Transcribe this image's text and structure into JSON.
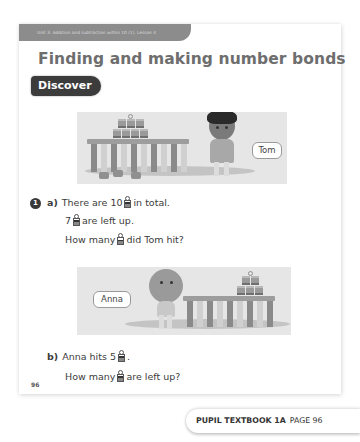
{
  "header": {
    "unit_banner": "Unit 3: Addition and subtraction within 10 (1), Lesson 4",
    "title": "Finding and making number bonds",
    "section_label": "Discover"
  },
  "illustrations": [
    {
      "name_tag": "Tom"
    },
    {
      "name_tag": "Anna"
    }
  ],
  "question": {
    "number": "1",
    "part_a": {
      "label": "a)",
      "line1_before": "There are 10",
      "line1_after": "in total.",
      "line2_before": "7",
      "line2_after": "are left up.",
      "line3_before": "How many",
      "line3_after": "did Tom hit?"
    },
    "part_b": {
      "label": "b)",
      "line1_before": "Anna hits 5",
      "line1_after": ".",
      "line2_before": "How many",
      "line2_after": "are left up?"
    }
  },
  "icons": {
    "can": "tin-can-icon"
  },
  "page_number": "96",
  "footer": {
    "book": "PUPIL TEXTBOOK 1A",
    "page": "PAGE 96"
  }
}
